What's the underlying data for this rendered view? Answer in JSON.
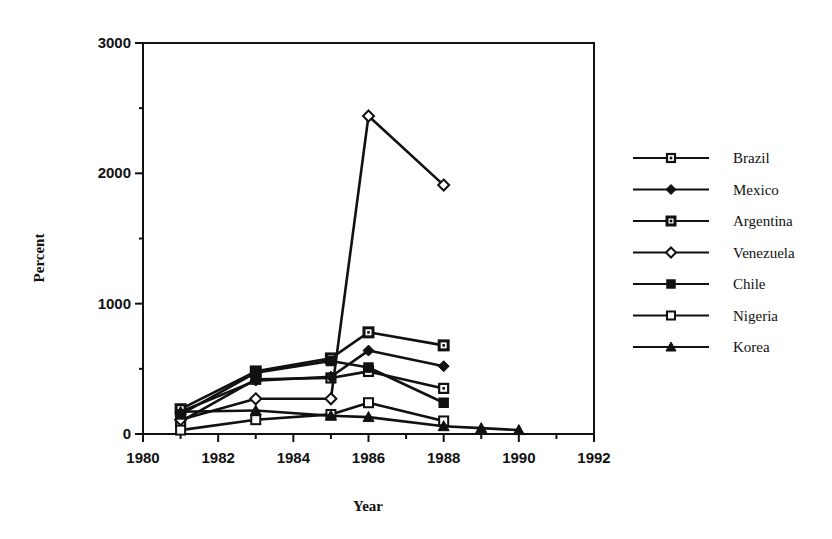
{
  "chart_data": {
    "type": "line",
    "title": "",
    "xlabel": "Year",
    "ylabel": "Percent",
    "xlim": [
      1980,
      1992
    ],
    "ylim": [
      0,
      3000
    ],
    "x_ticks": [
      1980,
      1982,
      1984,
      1986,
      1988,
      1990,
      1992
    ],
    "y_ticks": [
      0,
      1000,
      2000,
      3000
    ],
    "grid": false,
    "legend_position": "right",
    "series": [
      {
        "name": "Brazil",
        "marker": "square-dot",
        "x": [
          1981,
          1983,
          1985,
          1986,
          1988
        ],
        "values": [
          95,
          420,
          430,
          480,
          350
        ]
      },
      {
        "name": "Mexico",
        "marker": "diamond-filled",
        "x": [
          1981,
          1983,
          1985,
          1986,
          1988
        ],
        "values": [
          170,
          410,
          440,
          640,
          520
        ]
      },
      {
        "name": "Argentina",
        "marker": "square-dot-bold",
        "x": [
          1981,
          1983,
          1985,
          1986,
          1988
        ],
        "values": [
          190,
          480,
          580,
          780,
          680
        ]
      },
      {
        "name": "Venezuela",
        "marker": "diamond-open",
        "x": [
          1981,
          1983,
          1985,
          1986,
          1988
        ],
        "values": [
          110,
          270,
          270,
          2440,
          1910
        ]
      },
      {
        "name": "Chile",
        "marker": "square-filled",
        "x": [
          1981,
          1983,
          1985,
          1986,
          1988
        ],
        "values": [
          150,
          470,
          560,
          510,
          240
        ]
      },
      {
        "name": "Nigeria",
        "marker": "square-open",
        "x": [
          1981,
          1983,
          1985,
          1986,
          1988
        ],
        "values": [
          30,
          110,
          150,
          240,
          100
        ]
      },
      {
        "name": "Korea",
        "marker": "triangle-filled",
        "x": [
          1981,
          1983,
          1985,
          1986,
          1988,
          1989,
          1990
        ],
        "values": [
          170,
          180,
          140,
          130,
          60,
          45,
          30
        ]
      }
    ]
  },
  "colors": {
    "ink": "#111111",
    "background": "#ffffff"
  }
}
